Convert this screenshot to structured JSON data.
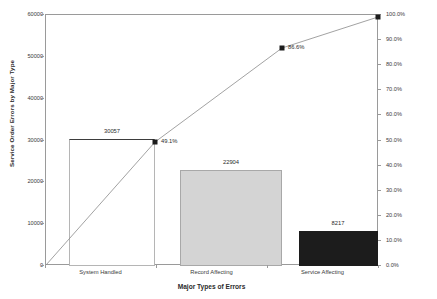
{
  "chart_data": {
    "type": "bar",
    "title": "",
    "subtitle": "",
    "xlabel": "Major Types of Errors",
    "ylabel": "Service Order Errors by Major Type",
    "y2label": "",
    "categories": [
      "System Handled",
      "Record Affecting",
      "Service Affecting"
    ],
    "values": [
      30057,
      22904,
      8217
    ],
    "value_labels": [
      "30057",
      "22904",
      "8217"
    ],
    "series": [
      {
        "name": "Service Order Errors by Major Type",
        "type": "bar",
        "values": [
          30057,
          22904,
          8217
        ]
      },
      {
        "name": "Cumulative Percentage",
        "type": "line",
        "values": [
          49.1,
          86.6,
          100.0
        ],
        "labels": [
          "49.1%",
          "86.6%",
          "100.0%"
        ]
      }
    ],
    "cumulative_labels": [
      "49.1%",
      "86.6%",
      "100.0%"
    ],
    "ylim": [
      0,
      60000
    ],
    "y2lim": [
      0,
      100
    ],
    "yticks": [
      0,
      10000,
      20000,
      30000,
      40000,
      50000,
      60000
    ],
    "ytick_labels": [
      "0",
      "10000",
      "20000",
      "30000",
      "40000",
      "50000",
      "60000"
    ],
    "y2ticks": [
      0,
      10,
      20,
      30,
      40,
      50,
      60,
      70,
      80,
      90,
      100
    ],
    "y2tick_labels": [
      "0.0%",
      "10.0%",
      "20.0%",
      "30.0%",
      "40.0%",
      "50.0%",
      "60.0%",
      "70.0%",
      "80.0%",
      "90.0%",
      "100.0%"
    ],
    "grid": false,
    "legend": "none",
    "bar_colors": [
      "#ffffff",
      "#d4d4d4",
      "#1c1c1c"
    ],
    "line_color": "#8a8a8a",
    "marker_color": "#1c1c1c",
    "axis_color": "#9a9a9a",
    "text_color": "#2b2b2b"
  }
}
